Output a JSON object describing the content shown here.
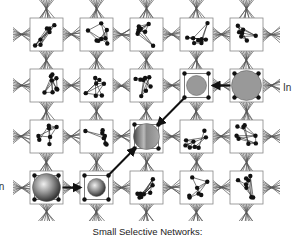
{
  "diagram": {
    "title": "Small Selective Networks",
    "caption": "Small Selective Networks:",
    "grid": {
      "rows": 4,
      "cols": 5,
      "x0": 30,
      "y0": 18,
      "dx": 50,
      "dy": 51,
      "box": 33
    },
    "colors": {
      "box_border": "#888888",
      "box_fill": "#ffffff",
      "node": "#111111",
      "edge": "#222222",
      "bundle": "#555555",
      "sphere_gray": "#999999",
      "arrow": "#111111"
    },
    "input_labels": [
      {
        "id": "in-right",
        "text": "In",
        "position": "right of row 2"
      },
      {
        "id": "in-left",
        "text": "In",
        "position": "left of row 4 (partially cropped)"
      }
    ],
    "active_networks": [
      {
        "row": 1,
        "col": 4,
        "style": "flat-gray",
        "radius": 15
      },
      {
        "row": 1,
        "col": 3,
        "style": "flat-gray",
        "radius": 10
      },
      {
        "row": 2,
        "col": 2,
        "style": "shaded-half",
        "radius": 13
      },
      {
        "row": 3,
        "col": 0,
        "style": "shaded",
        "radius": 14
      },
      {
        "row": 3,
        "col": 1,
        "style": "shaded",
        "radius": 9
      }
    ],
    "arrows": [
      {
        "from": [
          1,
          4
        ],
        "to": [
          1,
          3
        ],
        "label": "signal-flow"
      },
      {
        "from": [
          1,
          3
        ],
        "to": [
          2,
          2
        ],
        "label": "signal-flow"
      },
      {
        "from": [
          3,
          0
        ],
        "to": [
          3,
          1
        ],
        "label": "signal-flow"
      },
      {
        "from": [
          3,
          1
        ],
        "to": [
          2,
          2
        ],
        "label": "signal-flow"
      }
    ]
  }
}
